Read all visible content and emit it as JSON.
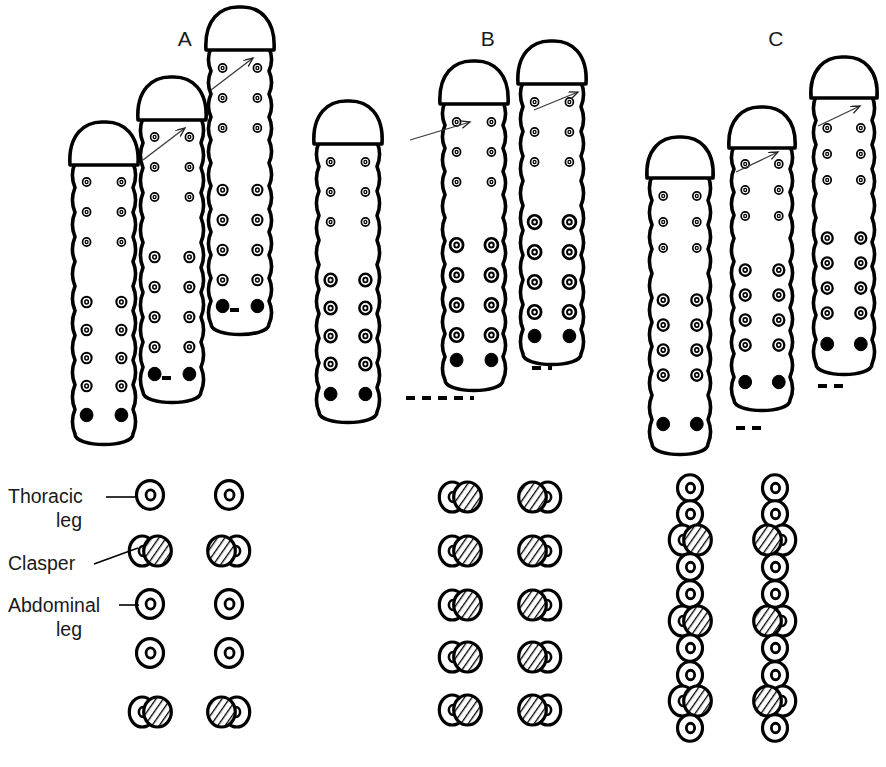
{
  "figure": {
    "background_color": "#ffffff",
    "ink_color": "#000000",
    "hatch_color": "#000000"
  },
  "panels": [
    {
      "id": "A",
      "label": "A",
      "label_x": 185,
      "label_y": 46,
      "larvae": [
        {
          "name": "larva-a-1",
          "x": 104,
          "body_top": 163,
          "body_bottom": 434,
          "width": 58,
          "head_height": 40,
          "legs_left": [
            182,
            212,
            242,
            302,
            330,
            358,
            386
          ],
          "legs_right": [
            182,
            212,
            242,
            302,
            330,
            358,
            386
          ],
          "leg_radius_small": 4.0,
          "leg_radius_large": 5.0,
          "small_count": 3,
          "claspers_y": 415
        },
        {
          "name": "larva-a-2",
          "x": 172,
          "body_top": 118,
          "body_bottom": 392,
          "width": 58,
          "head_height": 40,
          "legs_left": [
            137,
            167,
            197,
            257,
            287,
            317,
            347
          ],
          "legs_right": [
            137,
            167,
            197,
            257,
            287,
            317,
            347
          ],
          "leg_radius_small": 4.0,
          "leg_radius_large": 5.0,
          "small_count": 3,
          "claspers_y": 374
        },
        {
          "name": "larva-a-3",
          "x": 240,
          "body_top": 48,
          "body_bottom": 324,
          "width": 58,
          "head_height": 40,
          "legs_left": [
            68,
            98,
            128,
            190,
            220,
            250,
            280
          ],
          "legs_right": [
            68,
            98,
            128,
            190,
            220,
            250,
            280
          ],
          "leg_radius_small": 4.0,
          "leg_radius_large": 5.0,
          "small_count": 3,
          "claspers_y": 306
        }
      ],
      "arrows": [
        {
          "name": "arrow-a-1",
          "x1": 143,
          "y1": 160,
          "x2": 185,
          "y2": 128
        },
        {
          "name": "arrow-a-2",
          "x1": 211,
          "y1": 90,
          "x2": 253,
          "y2": 58
        }
      ],
      "connectors": [
        {
          "name": "connector-a-1",
          "x1": 162,
          "y1": 378,
          "x2": 172,
          "y2": 378
        },
        {
          "name": "connector-a-2",
          "x1": 230,
          "y1": 310,
          "x2": 240,
          "y2": 310
        }
      ],
      "diagram": {
        "columns": [
          150,
          229
        ],
        "rows": [
          {
            "y": 495,
            "type": "leg"
          },
          {
            "y": 551,
            "type": "clasper"
          },
          {
            "y": 604,
            "type": "leg"
          },
          {
            "y": 653,
            "type": "leg"
          },
          {
            "y": 712,
            "type": "clasper"
          }
        ]
      }
    },
    {
      "id": "B",
      "label": "B",
      "label_x": 488,
      "label_y": 46,
      "larvae": [
        {
          "name": "larva-b-1",
          "x": 348,
          "body_top": 142,
          "body_bottom": 412,
          "width": 58,
          "head_height": 40,
          "legs_left": [
            162,
            192,
            222,
            280,
            308,
            336,
            364
          ],
          "legs_right": [
            162,
            192,
            222,
            280,
            308,
            336,
            364
          ],
          "leg_radius_small": 4.0,
          "leg_radius_large": 6.0,
          "small_count": 3,
          "claspers_y": 394
        },
        {
          "name": "larva-b-2",
          "x": 474,
          "body_top": 102,
          "body_bottom": 380,
          "width": 58,
          "head_height": 40,
          "legs_left": [
            122,
            152,
            182,
            245,
            275,
            305,
            335
          ],
          "legs_right": [
            122,
            152,
            182,
            245,
            275,
            305,
            335
          ],
          "leg_radius_small": 4.0,
          "leg_radius_large": 6.5,
          "small_count": 3,
          "claspers_y": 360
        },
        {
          "name": "larva-b-3",
          "x": 552,
          "body_top": 82,
          "body_bottom": 354,
          "width": 58,
          "head_height": 40,
          "legs_left": [
            102,
            132,
            162,
            222,
            252,
            282,
            312
          ],
          "legs_right": [
            102,
            132,
            162,
            222,
            252,
            282,
            312
          ],
          "leg_radius_small": 4.0,
          "leg_radius_large": 6.5,
          "small_count": 3,
          "claspers_y": 336
        }
      ],
      "arrows": [
        {
          "name": "arrow-b-1",
          "x1": 410,
          "y1": 140,
          "x2": 470,
          "y2": 122
        },
        {
          "name": "arrow-b-2",
          "x1": 534,
          "y1": 110,
          "x2": 578,
          "y2": 92
        }
      ],
      "connectors": [
        {
          "name": "connector-b-1",
          "x1": 406,
          "y1": 398,
          "x2": 474,
          "y2": 398
        },
        {
          "name": "connector-b-2",
          "x1": 532,
          "y1": 368,
          "x2": 552,
          "y2": 368
        }
      ],
      "diagram": {
        "columns": [
          460,
          540
        ],
        "rows": [
          {
            "y": 497,
            "type": "clasper"
          },
          {
            "y": 551,
            "type": "clasper"
          },
          {
            "y": 605,
            "type": "clasper"
          },
          {
            "y": 657,
            "type": "clasper"
          },
          {
            "y": 710,
            "type": "clasper"
          }
        ]
      }
    },
    {
      "id": "C",
      "label": "C",
      "label_x": 776,
      "label_y": 46,
      "larvae": [
        {
          "name": "larva-c-1",
          "x": 680,
          "body_top": 176,
          "body_bottom": 444,
          "width": 56,
          "head_height": 38,
          "legs_left": [
            196,
            222,
            248,
            300,
            325,
            350,
            375
          ],
          "legs_right": [
            196,
            222,
            248,
            300,
            325,
            350,
            375
          ],
          "leg_radius_small": 4.0,
          "leg_radius_large": 5.5,
          "small_count": 3,
          "claspers_y": 424
        },
        {
          "name": "larva-c-2",
          "x": 762,
          "body_top": 146,
          "body_bottom": 400,
          "width": 56,
          "head_height": 38,
          "legs_left": [
            164,
            190,
            216,
            270,
            295,
            320,
            345
          ],
          "legs_right": [
            164,
            190,
            216,
            270,
            295,
            320,
            345
          ],
          "leg_radius_small": 4.0,
          "leg_radius_large": 5.5,
          "small_count": 3,
          "claspers_y": 382
        },
        {
          "name": "larva-c-3",
          "x": 844,
          "body_top": 96,
          "body_bottom": 364,
          "width": 56,
          "head_height": 38,
          "legs_left": [
            128,
            154,
            180,
            238,
            263,
            288,
            313
          ],
          "legs_right": [
            128,
            154,
            180,
            238,
            263,
            288,
            313
          ],
          "leg_radius_small": 4.0,
          "leg_radius_large": 5.5,
          "small_count": 3,
          "claspers_y": 344
        }
      ],
      "arrows": [
        {
          "name": "arrow-c-1",
          "x1": 736,
          "y1": 172,
          "x2": 778,
          "y2": 152
        },
        {
          "name": "arrow-c-2",
          "x1": 818,
          "y1": 126,
          "x2": 860,
          "y2": 106
        }
      ],
      "connectors": [
        {
          "name": "connector-c-1",
          "x1": 736,
          "y1": 428,
          "x2": 762,
          "y2": 428
        },
        {
          "name": "connector-c-2",
          "x1": 818,
          "y1": 386,
          "x2": 844,
          "y2": 386
        }
      ],
      "diagram": {
        "columns": [
          690,
          775
        ],
        "rows": [
          {
            "y": 488,
            "type": "leg"
          },
          {
            "y": 514,
            "type": "leg"
          },
          {
            "y": 540,
            "type": "clasper"
          },
          {
            "y": 567,
            "type": "leg"
          },
          {
            "y": 594,
            "type": "leg"
          },
          {
            "y": 621,
            "type": "clasper"
          },
          {
            "y": 648,
            "type": "leg"
          },
          {
            "y": 675,
            "type": "leg"
          },
          {
            "y": 701,
            "type": "clasper"
          },
          {
            "y": 728,
            "type": "leg"
          }
        ]
      }
    }
  ],
  "legend": {
    "items": [
      {
        "name": "legend-thoracic-leg",
        "label_line1": "Thoracic",
        "label_line2": "leg",
        "text_x": 8,
        "text_y1": 503,
        "text_y2": 527,
        "leader": {
          "x1": 106,
          "y1": 497,
          "x2": 136,
          "y2": 497
        },
        "symbol": "thoracic-leg-symbol"
      },
      {
        "name": "legend-clasper",
        "label_line1": "Clasper",
        "label_line2": "",
        "text_x": 8,
        "text_y1": 570,
        "text_y2": null,
        "leader": {
          "x1": 94,
          "y1": 564,
          "x2": 138,
          "y2": 548
        },
        "symbol": "clasper-symbol"
      },
      {
        "name": "legend-abdominal-leg",
        "label_line1": "Abdominal",
        "label_line2": "leg",
        "text_x": 8,
        "text_y1": 612,
        "text_y2": 636,
        "leader": {
          "x1": 119,
          "y1": 605,
          "x2": 139,
          "y2": 605
        },
        "symbol": "abdominal-leg-symbol"
      }
    ]
  }
}
